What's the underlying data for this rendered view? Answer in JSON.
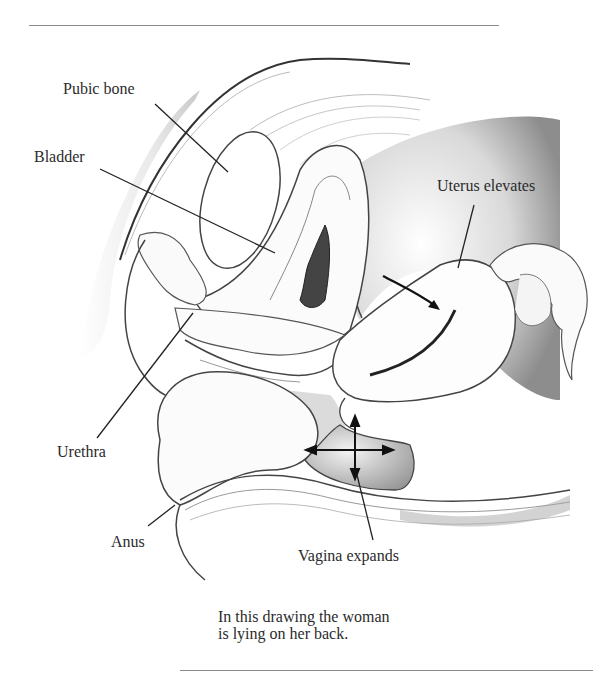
{
  "figure": {
    "labels": {
      "pubic_bone": "Pubic bone",
      "bladder": "Bladder",
      "uterus": "Uterus elevates",
      "urethra": "Urethra",
      "anus": "Anus",
      "vagina": "Vagina expands"
    },
    "caption": {
      "line1": "In this drawing the woman",
      "line2": "is lying on her back."
    },
    "colors": {
      "ink": "#2b2b2b",
      "rule": "#8a8a8a",
      "shade": "#9a9a9a",
      "background": "#ffffff"
    }
  }
}
